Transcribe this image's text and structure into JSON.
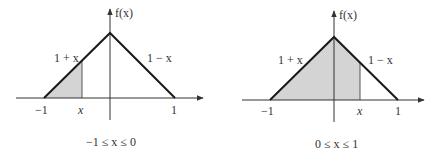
{
  "panels": [
    {
      "id": "left",
      "y_axis_label": "f(x)",
      "left_line_label": "1 + x",
      "right_line_label": "1 − x",
      "tick_neg_one": "−1",
      "tick_x": "x",
      "tick_one": "1",
      "caption": "−1 ≤ x ≤ 0"
    },
    {
      "id": "right",
      "y_axis_label": "f(x)",
      "left_line_label": "1 + x",
      "right_line_label": "1 − x",
      "tick_neg_one": "−1",
      "tick_x": "x",
      "tick_one": "1",
      "caption": "0 ≤ x ≤ 1"
    }
  ],
  "colors": {
    "line": "#1a1a1a",
    "axis": "#333333",
    "shade": "#d4d4d4"
  }
}
